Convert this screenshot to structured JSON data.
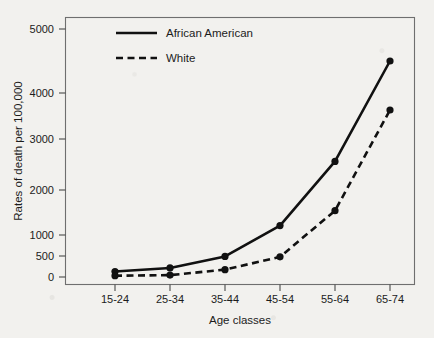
{
  "chart_data": {
    "type": "line",
    "title": "",
    "xlabel": "Age classes",
    "ylabel": "Rates of death per 100,000",
    "categories": [
      "15-24",
      "25-34",
      "35-44",
      "45-54",
      "55-64",
      "65-74"
    ],
    "series": [
      {
        "name": "African American",
        "style": "solid",
        "marker": "filled-circle",
        "color": "#111111",
        "values": [
          130,
          215,
          490,
          1210,
          2560,
          4500
        ]
      },
      {
        "name": "White",
        "style": "dashed",
        "marker": "filled-circle",
        "color": "#111111",
        "values": [
          30,
          45,
          175,
          480,
          1540,
          3630
        ]
      }
    ],
    "ytick_labels": [
      "0",
      "500",
      "1000",
      "2000",
      "3000",
      "4000",
      "5000"
    ],
    "ytick_values": [
      0,
      500,
      1000,
      2000,
      3000,
      4000,
      5000
    ],
    "ylim": [
      0,
      5250
    ],
    "yaxis_note": "non-linear tick spacing: 0-500-1000 compressed, then 1000 steps",
    "grid": false,
    "legend_position": "top-left-inside",
    "legend_entries": [
      "African American",
      "White"
    ]
  },
  "colors": {
    "ink": "#111111",
    "frame": "#6f6f6f",
    "paper": "#f2f1ee"
  }
}
